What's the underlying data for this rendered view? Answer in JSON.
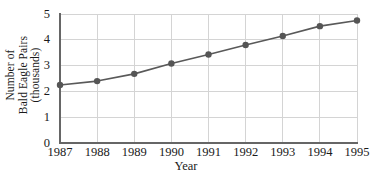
{
  "chart_data": {
    "type": "line",
    "title": "",
    "xlabel": "Year",
    "ylabel": "Number of Bald Eagle Pairs (thousands)",
    "ylabel_lines": [
      "Number of",
      "Bald Eagle Pairs",
      "(thousands)"
    ],
    "categories": [
      "1987",
      "1988",
      "1989",
      "1990",
      "1991",
      "1992",
      "1993",
      "1994",
      "1995"
    ],
    "x": [
      1987,
      1988,
      1989,
      1990,
      1991,
      1992,
      1993,
      1994,
      1995
    ],
    "values": [
      2.25,
      2.4,
      2.68,
      3.08,
      3.43,
      3.8,
      4.15,
      4.53,
      4.75
    ],
    "xtick_labels": [
      "1987",
      "1988",
      "1989",
      "1990",
      "1991",
      "1992",
      "1993",
      "1994",
      "1995"
    ],
    "ytick_labels": [
      "0",
      "1",
      "2",
      "3",
      "4",
      "5"
    ],
    "ytick_values": [
      0,
      1,
      2,
      3,
      4,
      5
    ],
    "ylim": [
      0,
      5
    ],
    "xlim": [
      1987,
      1995
    ],
    "grid": true,
    "legend": false,
    "marker": "circle",
    "colors": {
      "line": "#595959",
      "marker": "#555555",
      "grid": "#d4d4d4",
      "axis": "#666666",
      "background": "#ffffff",
      "text": "#1a1a1a"
    }
  }
}
